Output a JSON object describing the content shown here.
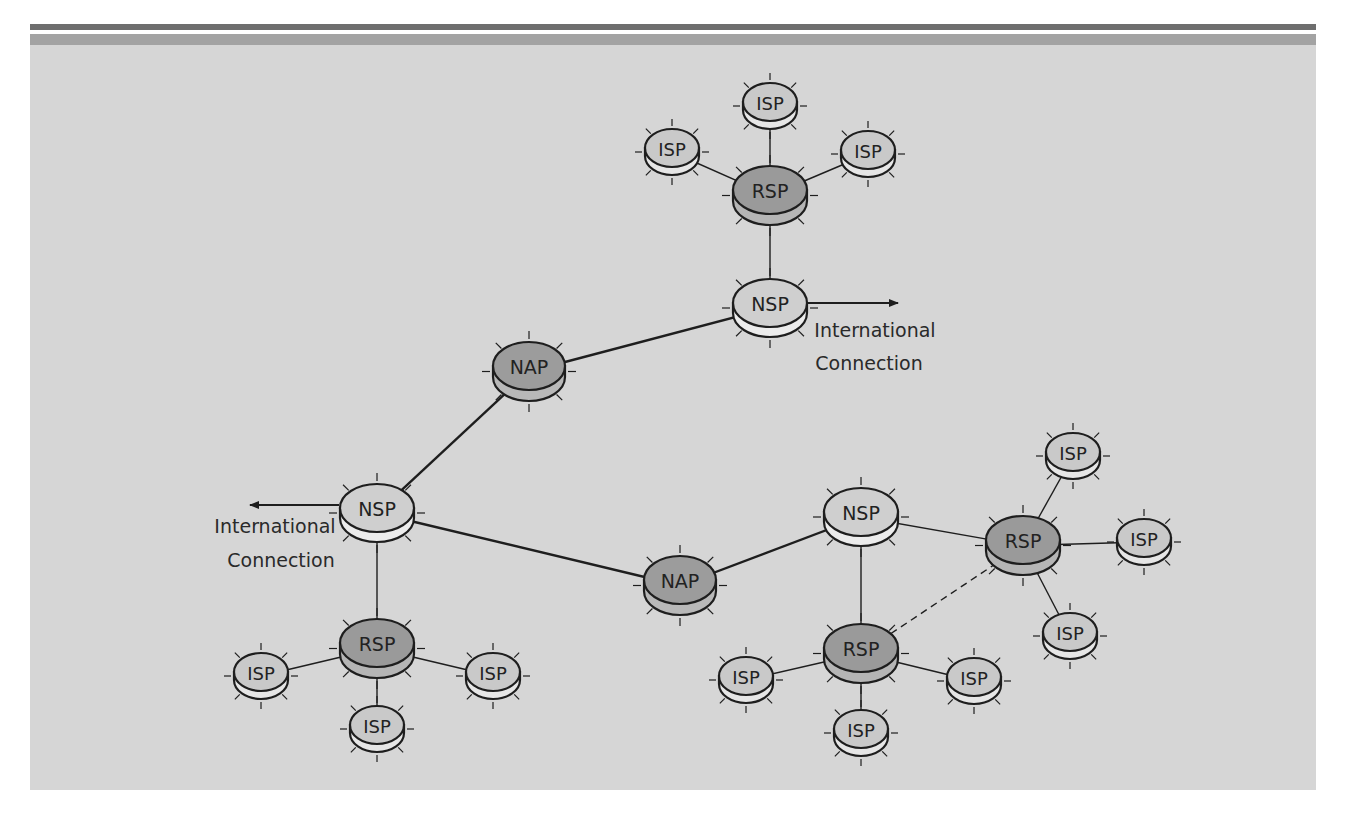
{
  "figure": {
    "type": "network-hierarchy-diagram",
    "colors": {
      "background": "#d6d6d6",
      "header_dark": "#6e6e6e",
      "header_mid": "#a3a3a3",
      "isp_fill": "#c9c9c9",
      "isp_side": "#e6e6e6",
      "nsp_fill": "#cfcfcf",
      "nsp_side": "#ececec",
      "rsp_fill": "#9a9a9a",
      "rsp_side": "#b5b5b5",
      "nap_fill": "#9c9c9c",
      "nap_side": "#b8b8b8",
      "stroke": "#1e1e1e"
    }
  },
  "annotations": {
    "intl_right_line1": "International",
    "intl_right_line2": "Connection",
    "intl_left_line1": "International",
    "intl_left_line2": "Connection"
  },
  "nodes": [
    {
      "id": "isp_top_top",
      "label": "ISP",
      "kind": "isp",
      "x": 770,
      "y": 102
    },
    {
      "id": "isp_top_left",
      "label": "ISP",
      "kind": "isp",
      "x": 672,
      "y": 148
    },
    {
      "id": "isp_top_right",
      "label": "ISP",
      "kind": "isp",
      "x": 868,
      "y": 150
    },
    {
      "id": "rsp_top",
      "label": "RSP",
      "kind": "rsp",
      "x": 770,
      "y": 190
    },
    {
      "id": "nsp_top",
      "label": "NSP",
      "kind": "nsp",
      "x": 770,
      "y": 303
    },
    {
      "id": "nap_upper",
      "label": "NAP",
      "kind": "nap",
      "x": 529,
      "y": 366
    },
    {
      "id": "nsp_left",
      "label": "NSP",
      "kind": "nsp",
      "x": 377,
      "y": 508
    },
    {
      "id": "nap_lower",
      "label": "NAP",
      "kind": "nap",
      "x": 680,
      "y": 580
    },
    {
      "id": "nsp_right",
      "label": "NSP",
      "kind": "nsp",
      "x": 861,
      "y": 512
    },
    {
      "id": "rsp_left",
      "label": "RSP",
      "kind": "rsp",
      "x": 377,
      "y": 643
    },
    {
      "id": "isp_left_left",
      "label": "ISP",
      "kind": "isp",
      "x": 261,
      "y": 672
    },
    {
      "id": "isp_left_right",
      "label": "ISP",
      "kind": "isp",
      "x": 493,
      "y": 672
    },
    {
      "id": "isp_left_bottom",
      "label": "ISP",
      "kind": "isp",
      "x": 377,
      "y": 725
    },
    {
      "id": "rsp_bottom",
      "label": "RSP",
      "kind": "rsp",
      "x": 861,
      "y": 648
    },
    {
      "id": "isp_bottom_left",
      "label": "ISP",
      "kind": "isp",
      "x": 746,
      "y": 676
    },
    {
      "id": "isp_bottom_right",
      "label": "ISP",
      "kind": "isp",
      "x": 974,
      "y": 677
    },
    {
      "id": "isp_bottom_bottom",
      "label": "ISP",
      "kind": "isp",
      "x": 861,
      "y": 729
    },
    {
      "id": "rsp_right",
      "label": "RSP",
      "kind": "rsp",
      "x": 1023,
      "y": 540
    },
    {
      "id": "isp_right_top",
      "label": "ISP",
      "kind": "isp",
      "x": 1073,
      "y": 452
    },
    {
      "id": "isp_right_right",
      "label": "ISP",
      "kind": "isp",
      "x": 1144,
      "y": 538
    },
    {
      "id": "isp_right_bottom",
      "label": "ISP",
      "kind": "isp",
      "x": 1070,
      "y": 632
    }
  ],
  "links": [
    {
      "from": "isp_top_top",
      "to": "rsp_top",
      "style": "thin"
    },
    {
      "from": "isp_top_left",
      "to": "rsp_top",
      "style": "thin"
    },
    {
      "from": "isp_top_right",
      "to": "rsp_top",
      "style": "thin"
    },
    {
      "from": "rsp_top",
      "to": "nsp_top",
      "style": "thin"
    },
    {
      "from": "nsp_top",
      "to": "nap_upper",
      "style": "thick"
    },
    {
      "from": "nap_upper",
      "to": "nsp_left",
      "style": "thick"
    },
    {
      "from": "nsp_left",
      "to": "nap_lower",
      "style": "thick"
    },
    {
      "from": "nap_lower",
      "to": "nsp_right",
      "style": "thick"
    },
    {
      "from": "nsp_left",
      "to": "rsp_left",
      "style": "thin"
    },
    {
      "from": "rsp_left",
      "to": "isp_left_left",
      "style": "thin"
    },
    {
      "from": "rsp_left",
      "to": "isp_left_right",
      "style": "thin"
    },
    {
      "from": "rsp_left",
      "to": "isp_left_bottom",
      "style": "thin"
    },
    {
      "from": "nsp_right",
      "to": "rsp_bottom",
      "style": "thin"
    },
    {
      "from": "nsp_right",
      "to": "rsp_right",
      "style": "thin"
    },
    {
      "from": "rsp_bottom",
      "to": "rsp_right",
      "style": "dashed"
    },
    {
      "from": "rsp_bottom",
      "to": "isp_bottom_left",
      "style": "thin"
    },
    {
      "from": "rsp_bottom",
      "to": "isp_bottom_right",
      "style": "thin"
    },
    {
      "from": "rsp_bottom",
      "to": "isp_bottom_bottom",
      "style": "thin"
    },
    {
      "from": "rsp_right",
      "to": "isp_right_top",
      "style": "thin"
    },
    {
      "from": "rsp_right",
      "to": "isp_right_right",
      "style": "thin"
    },
    {
      "from": "rsp_right",
      "to": "isp_right_bottom",
      "style": "thin"
    }
  ],
  "arrows": [
    {
      "from": "nsp_top",
      "direction": "right",
      "x1": 808,
      "y1": 303,
      "x2": 898,
      "y2": 303
    },
    {
      "from": "nsp_left",
      "direction": "left",
      "x1": 339,
      "y1": 505,
      "x2": 250,
      "y2": 505
    }
  ]
}
